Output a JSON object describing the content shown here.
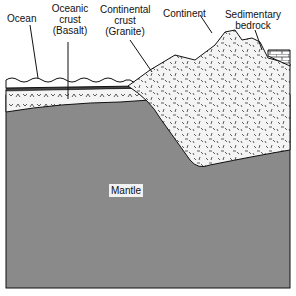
{
  "diagram": {
    "labels": {
      "ocean": "Ocean",
      "oceanic_crust_1": "Oceanic",
      "oceanic_crust_2": "crust",
      "oceanic_crust_3": "(Basalt)",
      "continental_crust_1": "Continental",
      "continental_crust_2": "crust",
      "continental_crust_3": "(Granite)",
      "continent": "Continent",
      "sedimentary_1": "Sedimentary",
      "sedimentary_2": "bedrock",
      "mantle": "Mantle"
    },
    "colors": {
      "mantle": "#8a8a8a",
      "crust_fill": "#f4f4f4",
      "outline": "#111111"
    }
  }
}
